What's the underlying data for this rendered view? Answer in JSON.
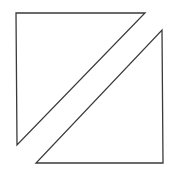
{
  "diagram": {
    "background": "#ffffff",
    "stroke_color": "#3a3a3a",
    "stroke_width": 1.3,
    "shapes": [
      {
        "name": "upper-left-triangle",
        "type": "polygon",
        "points": [
          [
            16,
            13
          ],
          [
            145,
            13
          ],
          [
            17,
            145
          ]
        ]
      },
      {
        "name": "lower-right-triangle",
        "type": "polygon",
        "points": [
          [
            162,
            30
          ],
          [
            163,
            163
          ],
          [
            36,
            163
          ]
        ]
      }
    ]
  }
}
